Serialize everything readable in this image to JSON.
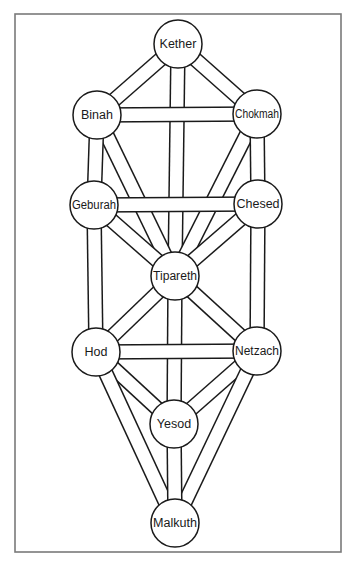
{
  "diagram": {
    "colors": {
      "line": "#1a1a1a",
      "fill": "#ffffff",
      "frame": "#7a7a7a"
    },
    "frame": {
      "x": 15,
      "y": 14,
      "width": 326,
      "height": 538
    },
    "node_radius": 24,
    "nodes": [
      {
        "id": "kether",
        "label": "Kether",
        "x": 178,
        "y": 44
      },
      {
        "id": "binah",
        "label": "Binah",
        "x": 97,
        "y": 115
      },
      {
        "id": "chokmah",
        "label": "Chokmah",
        "x": 257,
        "y": 114
      },
      {
        "id": "geburah",
        "label": "Geburah",
        "x": 94,
        "y": 205
      },
      {
        "id": "chesed",
        "label": "Chesed",
        "x": 258,
        "y": 204
      },
      {
        "id": "tipareth",
        "label": "Tipareth",
        "x": 175,
        "y": 276
      },
      {
        "id": "hod",
        "label": "Hod",
        "x": 96,
        "y": 352
      },
      {
        "id": "netzach",
        "label": "Netzach",
        "x": 257,
        "y": 351
      },
      {
        "id": "yesod",
        "label": "Yesod",
        "x": 174,
        "y": 424
      },
      {
        "id": "malkuth",
        "label": "Malkuth",
        "x": 175,
        "y": 523
      }
    ],
    "paths": [
      {
        "from": "kether",
        "to": "tipareth"
      },
      {
        "from": "binah",
        "to": "tipareth"
      },
      {
        "from": "chokmah",
        "to": "tipareth"
      },
      {
        "from": "geburah",
        "to": "tipareth"
      },
      {
        "from": "chesed",
        "to": "tipareth"
      },
      {
        "from": "tipareth",
        "to": "yesod"
      },
      {
        "from": "tipareth",
        "to": "hod"
      },
      {
        "from": "tipareth",
        "to": "netzach"
      },
      {
        "from": "kether",
        "to": "binah"
      },
      {
        "from": "kether",
        "to": "chokmah"
      },
      {
        "from": "binah",
        "to": "geburah"
      },
      {
        "from": "chokmah",
        "to": "chesed"
      },
      {
        "from": "geburah",
        "to": "hod"
      },
      {
        "from": "chesed",
        "to": "netzach"
      },
      {
        "from": "hod",
        "to": "yesod"
      },
      {
        "from": "netzach",
        "to": "yesod"
      },
      {
        "from": "hod",
        "to": "malkuth"
      },
      {
        "from": "netzach",
        "to": "malkuth"
      },
      {
        "from": "yesod",
        "to": "malkuth"
      },
      {
        "from": "binah",
        "to": "chokmah"
      },
      {
        "from": "geburah",
        "to": "chesed"
      },
      {
        "from": "hod",
        "to": "netzach"
      }
    ]
  }
}
